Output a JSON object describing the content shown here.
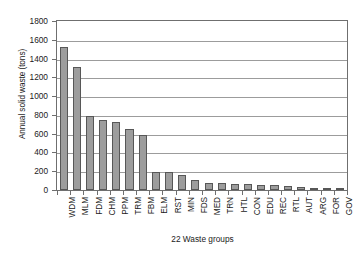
{
  "chart_data": {
    "type": "bar",
    "title": "",
    "xlabel": "22 Waste groups",
    "ylabel": "Annual solid waste (tons)",
    "ylim": [
      0,
      1800
    ],
    "ytick_values": [
      0,
      200,
      400,
      600,
      800,
      1000,
      1200,
      1400,
      1600,
      1800
    ],
    "ytick_labels": [
      "0",
      "200",
      "400",
      "600",
      "800",
      "1000",
      "1200",
      "1400",
      "1600",
      "1800"
    ],
    "grid": "horizontal",
    "legend": "none",
    "bar_color": "#9d9d9d",
    "bar_edge_color": "#575757",
    "axis_color": "#6f6f6f",
    "categories": [
      "WDM",
      "MLM",
      "FDM",
      "CHM",
      "PPM",
      "TRM",
      "FBM",
      "ELM",
      "RST",
      "MIN",
      "FDS",
      "MED",
      "TRN",
      "HTL",
      "CON",
      "EDU",
      "REC",
      "RTL",
      "AUT",
      "ARG",
      "FOR",
      "GOV"
    ],
    "values": [
      1520,
      1310,
      785,
      750,
      720,
      650,
      590,
      195,
      195,
      155,
      105,
      75,
      70,
      60,
      60,
      55,
      50,
      45,
      30,
      25,
      15,
      10
    ]
  }
}
